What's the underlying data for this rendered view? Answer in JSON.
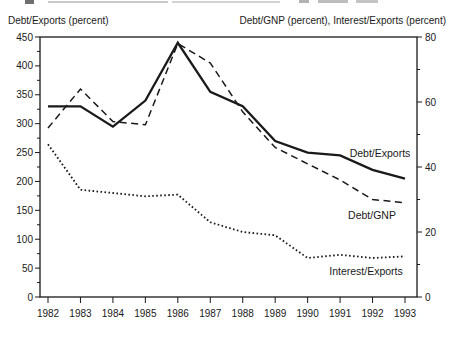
{
  "figure": {
    "left_axis_title": "Debt/Exports (percent)",
    "right_axis_title": "Debt/GNP (percent), Interest/Exports (percent)"
  },
  "chart_data": {
    "type": "line",
    "x": [
      1982,
      1983,
      1984,
      1985,
      1986,
      1987,
      1988,
      1989,
      1990,
      1991,
      1992,
      1993
    ],
    "x_labels": [
      "1982",
      "1983",
      "1984",
      "1985",
      "1986",
      "1987",
      "1988",
      "1989",
      "1990",
      "1991",
      "1992",
      "1993"
    ],
    "left_axis": {
      "title": "Debt/Exports (percent)",
      "min": 0,
      "max": 450,
      "major_step": 50,
      "minor_step": 25
    },
    "right_axis": {
      "title": "Debt/GNP (percent), Interest/Exports (percent)",
      "min": 0,
      "max": 80,
      "major_step": 20,
      "minor_step": 10
    },
    "grid": false,
    "legend": "inline-curve-labels",
    "series": [
      {
        "name": "Debt/Exports",
        "axis": "left",
        "line_style": "solid",
        "values": [
          330,
          330,
          295,
          340,
          440,
          355,
          330,
          270,
          250,
          245,
          220,
          205
        ]
      },
      {
        "name": "Debt/GNP",
        "axis": "right",
        "line_style": "dashed",
        "values": [
          52,
          64,
          54,
          53,
          78,
          72,
          57,
          46,
          41,
          36,
          30,
          29
        ]
      },
      {
        "name": "Interest/Exports",
        "axis": "right",
        "line_style": "dotted",
        "values": [
          47,
          33,
          32,
          31,
          31.5,
          23,
          20,
          19,
          12,
          13,
          12,
          12.5
        ]
      }
    ],
    "colors": {
      "line": "#1a1a1a",
      "text": "#1a1a1a",
      "background": "#ffffff"
    }
  }
}
